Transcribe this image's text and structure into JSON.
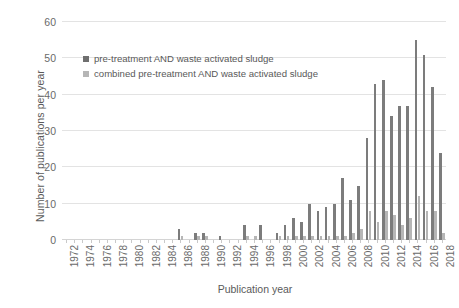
{
  "chart_data": {
    "type": "bar",
    "title": "",
    "xlabel": "Publication year",
    "ylabel": "Number of publications per year",
    "ylim": [
      0,
      60
    ],
    "ytick_step": 10,
    "yticks": [
      0,
      10,
      20,
      30,
      40,
      50,
      60
    ],
    "grid": true,
    "legend_position": "inside-upper-left",
    "xtick_labels": [
      "1972",
      "1974",
      "1976",
      "1978",
      "1980",
      "1982",
      "1984",
      "1986",
      "1988",
      "1990",
      "1992",
      "1994",
      "1996",
      "1998",
      "2000",
      "2002",
      "2004",
      "2006",
      "2008",
      "2010",
      "2012",
      "2014",
      "2016",
      "2018"
    ],
    "x": [
      1972,
      1973,
      1974,
      1975,
      1976,
      1977,
      1978,
      1979,
      1980,
      1981,
      1982,
      1983,
      1984,
      1985,
      1986,
      1987,
      1988,
      1989,
      1990,
      1991,
      1992,
      1993,
      1994,
      1995,
      1996,
      1997,
      1998,
      1999,
      2000,
      2001,
      2002,
      2003,
      2004,
      2005,
      2006,
      2007,
      2008,
      2009,
      2010,
      2011,
      2012,
      2013,
      2014,
      2015,
      2016,
      2017,
      2018
    ],
    "series": [
      {
        "name": "pre-treatment AND waste activated sludge",
        "color": "#7c7c7c",
        "values": [
          0,
          0,
          0,
          0,
          0,
          0,
          0,
          0,
          0,
          0,
          0,
          0,
          0,
          0,
          3,
          0,
          2,
          2,
          0,
          1,
          0,
          0,
          4,
          0,
          4,
          0,
          2,
          4,
          6,
          5,
          10,
          8,
          9,
          10,
          17,
          11,
          15,
          28,
          43,
          44,
          34,
          37,
          37,
          55,
          51,
          42,
          24
        ]
      },
      {
        "name": "combined pre-treatment AND waste activated sludge",
        "color": "#b6b6b6",
        "values": [
          0,
          0,
          0,
          0,
          0,
          0,
          0,
          0,
          0,
          0,
          0,
          0,
          0,
          0,
          1,
          0,
          1,
          1,
          0,
          0,
          0,
          0,
          1,
          1,
          0,
          0,
          1,
          1,
          1,
          1,
          1,
          1,
          1,
          1,
          1,
          2,
          3,
          8,
          5,
          8,
          7,
          4,
          6,
          12,
          8,
          8,
          2
        ]
      }
    ]
  },
  "legend": {
    "items": [
      {
        "label": "pre-treatment AND waste activated sludge",
        "swatch": "dark"
      },
      {
        "label": "combined pre-treatment AND waste activated sludge",
        "swatch": "light"
      }
    ]
  },
  "axes": {
    "y_title": "Number of publications per year",
    "x_title": "Publication year"
  }
}
